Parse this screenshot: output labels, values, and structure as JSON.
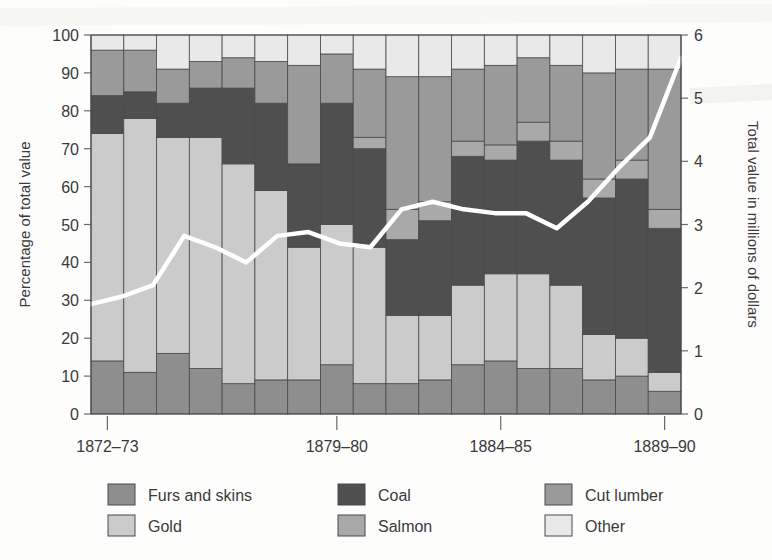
{
  "chart_data": {
    "type": "bar",
    "title": "",
    "subtitle": "",
    "stacked": true,
    "ylabel": "Percentage of total value",
    "ylabel_right": "Total value in millions of dollars",
    "xlabel": "",
    "ylim": [
      0,
      100
    ],
    "ylim_right": [
      0,
      6
    ],
    "yticks": [
      0,
      10,
      20,
      30,
      40,
      50,
      60,
      70,
      80,
      90,
      100
    ],
    "yticks_right": [
      0,
      1,
      2,
      3,
      4,
      5,
      6
    ],
    "grid": false,
    "legend_position": "bottom",
    "categories": [
      "1872-73",
      "1873-74",
      "1874-75",
      "1875-76",
      "1876-77",
      "1877-78",
      "1878-79",
      "1879-80",
      "1880-81",
      "1881-82",
      "1882-83",
      "1883-84",
      "1884-85",
      "1885-86",
      "1886-87",
      "1887-88",
      "1888-89",
      "1889-90"
    ],
    "xtick_labels": [
      "1872–73",
      "1879–80",
      "1884–85",
      "1889–90"
    ],
    "xtick_indices": [
      0,
      7,
      12,
      17
    ],
    "series": [
      {
        "name": "Furs and skins",
        "color": "#8e8e8e",
        "values": [
          14,
          11,
          16,
          12,
          8,
          9,
          9,
          13,
          8,
          8,
          9,
          13,
          14,
          12,
          12,
          9,
          10,
          6
        ]
      },
      {
        "name": "Gold",
        "color": "#cbcbcb",
        "values": [
          60,
          67,
          57,
          61,
          58,
          50,
          35,
          37,
          36,
          18,
          17,
          21,
          23,
          25,
          22,
          12,
          10,
          5
        ]
      },
      {
        "name": "Coal",
        "color": "#4f4f4f",
        "values": [
          10,
          7,
          9,
          13,
          20,
          23,
          22,
          32,
          26,
          20,
          25,
          34,
          30,
          35,
          33,
          36,
          42,
          38
        ]
      },
      {
        "name": "Salmon",
        "color": "#a9a9a9",
        "values": [
          0,
          0,
          0,
          0,
          0,
          0,
          0,
          0,
          3,
          8,
          5,
          4,
          4,
          5,
          5,
          5,
          5,
          5
        ]
      },
      {
        "name": "Cut lumber",
        "color": "#9a9a9a",
        "values": [
          12,
          11,
          9,
          7,
          8,
          11,
          26,
          13,
          18,
          35,
          33,
          19,
          21,
          17,
          20,
          28,
          24,
          37
        ]
      },
      {
        "name": "Other",
        "color": "#e9e9e9",
        "values": [
          4,
          4,
          9,
          7,
          6,
          7,
          8,
          5,
          9,
          11,
          11,
          9,
          8,
          6,
          8,
          10,
          9,
          9
        ]
      }
    ],
    "line_series": {
      "name": "Total value",
      "color": "#ffffff",
      "axis": "right",
      "values_percent_scale": [
        29,
        31,
        34,
        47,
        44,
        40,
        47,
        48,
        45,
        44,
        54,
        56,
        54,
        53,
        53,
        49,
        56,
        65,
        73,
        94
      ],
      "values": [
        1.74,
        1.86,
        2.04,
        2.82,
        2.64,
        2.4,
        2.82,
        2.88,
        2.7,
        2.64,
        3.24,
        3.36,
        3.24,
        3.18,
        3.18,
        2.94,
        3.36,
        3.9,
        4.38,
        5.64
      ]
    }
  },
  "axes": {
    "left_title": "Percentage of total value",
    "right_title": "Total value in millions of dollars",
    "left_ticks": [
      "0",
      "10",
      "20",
      "30",
      "40",
      "50",
      "60",
      "70",
      "80",
      "90",
      "100"
    ],
    "right_ticks": [
      "0",
      "1",
      "2",
      "3",
      "4",
      "5",
      "6"
    ],
    "x_ticks": [
      "1872–73",
      "1879–80",
      "1884–85",
      "1889–90"
    ]
  },
  "legend": {
    "items": [
      {
        "label": "Furs and skins",
        "color": "#8e8e8e"
      },
      {
        "label": "Gold",
        "color": "#cbcbcb"
      },
      {
        "label": "Coal",
        "color": "#4f4f4f"
      },
      {
        "label": "Salmon",
        "color": "#a9a9a9"
      },
      {
        "label": "Cut lumber",
        "color": "#9a9a9a"
      },
      {
        "label": "Other",
        "color": "#e9e9e9"
      }
    ]
  }
}
